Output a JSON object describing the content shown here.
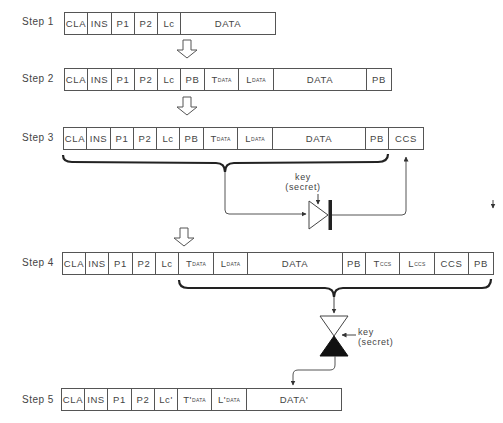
{
  "steps": [
    {
      "label": "Step 1",
      "cells": [
        {
          "main": "CLA",
          "sub": ""
        },
        {
          "main": "INS",
          "sub": ""
        },
        {
          "main": "P1",
          "sub": ""
        },
        {
          "main": "P2",
          "sub": ""
        },
        {
          "main": "Lc",
          "sub": ""
        },
        {
          "main": "DATA",
          "sub": ""
        }
      ]
    },
    {
      "label": "Step 2",
      "cells": [
        {
          "main": "CLA",
          "sub": ""
        },
        {
          "main": "INS",
          "sub": ""
        },
        {
          "main": "P1",
          "sub": ""
        },
        {
          "main": "P2",
          "sub": ""
        },
        {
          "main": "Lc",
          "sub": ""
        },
        {
          "main": "PB",
          "sub": ""
        },
        {
          "main": "T",
          "sub": "DATA"
        },
        {
          "main": "L",
          "sub": "DATA"
        },
        {
          "main": "DATA",
          "sub": ""
        },
        {
          "main": "PB",
          "sub": ""
        }
      ]
    },
    {
      "label": "Step 3",
      "cells": [
        {
          "main": "CLA",
          "sub": ""
        },
        {
          "main": "INS",
          "sub": ""
        },
        {
          "main": "P1",
          "sub": ""
        },
        {
          "main": "P2",
          "sub": ""
        },
        {
          "main": "Lc",
          "sub": ""
        },
        {
          "main": "PB",
          "sub": ""
        },
        {
          "main": "T",
          "sub": "DATA"
        },
        {
          "main": "L",
          "sub": "DATA"
        },
        {
          "main": "DATA",
          "sub": ""
        },
        {
          "main": "PB",
          "sub": ""
        },
        {
          "main": "CCS",
          "sub": ""
        }
      ]
    },
    {
      "label": "Step 4",
      "cells": [
        {
          "main": "CLA",
          "sub": ""
        },
        {
          "main": "INS",
          "sub": ""
        },
        {
          "main": "P1",
          "sub": ""
        },
        {
          "main": "P2",
          "sub": ""
        },
        {
          "main": "Lc",
          "sub": ""
        },
        {
          "main": "T",
          "sub": "DATA"
        },
        {
          "main": "L",
          "sub": "DATA"
        },
        {
          "main": "DATA",
          "sub": ""
        },
        {
          "main": "PB",
          "sub": ""
        },
        {
          "main": "T",
          "sub": "CCS"
        },
        {
          "main": "L",
          "sub": "CCS"
        },
        {
          "main": "CCS",
          "sub": ""
        },
        {
          "main": "PB",
          "sub": ""
        }
      ]
    },
    {
      "label": "Step 5",
      "cells": [
        {
          "main": "CLA",
          "sub": ""
        },
        {
          "main": "INS",
          "sub": ""
        },
        {
          "main": "P1",
          "sub": ""
        },
        {
          "main": "P2",
          "sub": ""
        },
        {
          "main": "Lc'",
          "sub": ""
        },
        {
          "main": "T'",
          "sub": "DATA"
        },
        {
          "main": "L'",
          "sub": "DATA"
        },
        {
          "main": "DATA'",
          "sub": ""
        }
      ]
    }
  ],
  "key_labels": [
    {
      "line1": "key",
      "line2": "(secret)"
    },
    {
      "line1": "key",
      "line2": "(secret)"
    }
  ],
  "colors": {
    "stroke": "#555555",
    "brace": "#222222",
    "text": "#444444",
    "background": "#ffffff"
  }
}
